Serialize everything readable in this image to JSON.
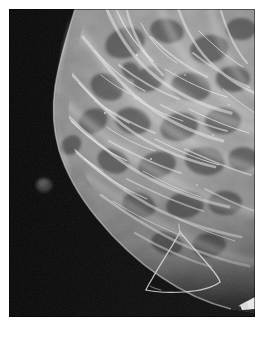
{
  "page": {
    "background_color": "#ffffff",
    "width": 263,
    "height": 339
  },
  "scan": {
    "modality_label": "mammogram",
    "view_label": "",
    "panel": {
      "x": 9,
      "y": 9,
      "width": 246,
      "height": 308
    },
    "background_color": "#060606",
    "tissue_color": "#b9b9b9",
    "annotation_color": "#d8d8d8",
    "marker_color": "#f2f2f2",
    "skin_marker": {
      "name": "skin-marker-blob",
      "x": 44,
      "y": 185,
      "radius": 7,
      "color": "#3a3a3a"
    },
    "edge_marker": {
      "name": "edge-wedge-marker",
      "x": 243,
      "y": 297,
      "color": "#f4f4f4"
    },
    "annotation": {
      "name": "lesion-outline",
      "shape": "hand-drawn-polygon",
      "apex": {
        "x": 180,
        "y": 232
      },
      "stroke_color": "#d6d6d6",
      "stroke_width": 1.2
    }
  },
  "caption": {
    "left_text": "",
    "mid_text": "",
    "right_text": ""
  }
}
